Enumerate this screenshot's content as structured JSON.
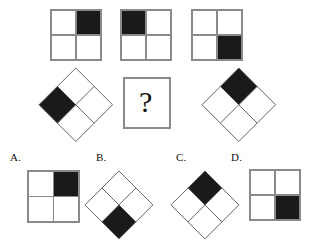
{
  "puzzle": {
    "type": "visual-analogy-matrix",
    "question_mark": "?",
    "colors": {
      "fill": "#1a1a1a",
      "empty": "#ffffff",
      "stroke": "#8a8a8a",
      "stroke_dark": "#555555",
      "background": "#ffffff",
      "text": "#111111"
    },
    "stem": {
      "row1": [
        {
          "name": "stem-1",
          "shape": "square",
          "grid": 2,
          "filled_cell": "top-right",
          "x": 51,
          "y": 10,
          "size": 50
        },
        {
          "name": "stem-2",
          "shape": "square",
          "grid": 2,
          "filled_cell": "top-left",
          "x": 121,
          "y": 10,
          "size": 50
        },
        {
          "name": "stem-3",
          "shape": "square",
          "grid": 2,
          "filled_cell": "bottom-right",
          "x": 192,
          "y": 10,
          "size": 50
        }
      ],
      "row2": [
        {
          "name": "stem-4",
          "shape": "diamond",
          "grid": 2,
          "filled_cell": "top",
          "cx": 76,
          "cy": 105,
          "size": 52
        },
        {
          "name": "stem-answer-box",
          "shape": "question-box",
          "x": 124,
          "y": 78,
          "w": 46,
          "h": 50
        },
        {
          "name": "stem-5",
          "shape": "diamond",
          "grid": 2,
          "filled_cell": "right",
          "cx": 239,
          "cy": 105,
          "size": 52
        }
      ]
    },
    "options": [
      {
        "key": "A",
        "label": "A.",
        "label_x": 10,
        "label_y": 152,
        "shape": "square",
        "filled_cell": "bottom-right",
        "x": 28,
        "y": 171,
        "size": 51
      },
      {
        "key": "B",
        "label": "B.",
        "label_x": 96,
        "label_y": 152,
        "shape": "diamond",
        "filled_cell": "left",
        "cx": 119,
        "cy": 205,
        "size": 48
      },
      {
        "key": "C",
        "label": "C.",
        "label_x": 176,
        "label_y": 152,
        "shape": "diamond",
        "filled_cell": "right",
        "cx": 205,
        "cy": 205,
        "size": 48
      },
      {
        "key": "D",
        "label": "D.",
        "label_x": 231,
        "label_y": 152,
        "shape": "square",
        "filled_cell": "bottom-right",
        "x": 250,
        "y": 170,
        "size": 50
      }
    ],
    "option_a_override": {
      "filled_cell": "top-right"
    }
  }
}
